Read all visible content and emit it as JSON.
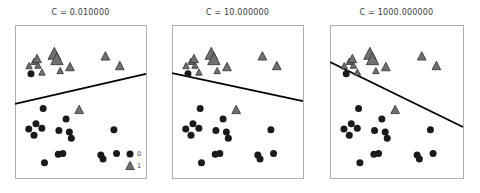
{
  "figure": {
    "background_color": "#ffffff",
    "frame_color": "#b0b0b0",
    "boundary_color": "#000000",
    "class0_color": "#1a1a1a",
    "class1_color": "#707070",
    "class1_edge_color": "#303030"
  },
  "panels": [
    {
      "id": "panel-1",
      "title": "C = 0.010000",
      "frame": {
        "x": 15,
        "y": 25,
        "width": 131,
        "height": 153
      },
      "has_legend": true,
      "legend": {
        "entries": [
          {
            "label": "0",
            "marker": "circle"
          },
          {
            "label": "1",
            "marker": "triangle"
          }
        ]
      },
      "boundary": {
        "x1": 15,
        "y1": 104,
        "x2": 146,
        "y2": 74
      }
    },
    {
      "id": "panel-2",
      "title": "C = 10.000000",
      "frame": {
        "x": 172,
        "y": 25,
        "width": 131,
        "height": 153
      },
      "has_legend": false,
      "boundary": {
        "x1": 172,
        "y1": 73,
        "x2": 303,
        "y2": 101
      }
    },
    {
      "id": "panel-3",
      "title": "C = 1000.000000",
      "frame": {
        "x": 330,
        "y": 25,
        "width": 133,
        "height": 153
      },
      "has_legend": false,
      "boundary": {
        "x1": 331,
        "y1": 62,
        "x2": 463,
        "y2": 127
      }
    }
  ],
  "chart_data": {
    "type": "scatter",
    "xlabel": "",
    "ylabel": "",
    "grid": false,
    "legend_position": "lower right (panel 1 only)",
    "class_labels": [
      "0",
      "1"
    ],
    "marker_map": {
      "0": "circle",
      "1": "triangle"
    },
    "panel_titles": [
      "C = 0.010000",
      "C = 10.000000",
      "C = 1000.000000"
    ],
    "panels": [
      {
        "title": "C = 0.010000",
        "boundary_line": {
          "x1": 0.0,
          "y1": 0.516,
          "x2": 1.0,
          "y2": 0.32
        },
        "points": [
          {
            "x": 0.107,
            "y": 0.268,
            "class": "1",
            "size": "small"
          },
          {
            "x": 0.145,
            "y": 0.24,
            "class": "1",
            "size": "small"
          },
          {
            "x": 0.168,
            "y": 0.222,
            "class": "1",
            "size": "medium"
          },
          {
            "x": 0.176,
            "y": 0.265,
            "class": "1",
            "size": "small"
          },
          {
            "x": 0.206,
            "y": 0.31,
            "class": "1",
            "size": "small"
          },
          {
            "x": 0.3,
            "y": 0.19,
            "class": "1",
            "size": "large"
          },
          {
            "x": 0.32,
            "y": 0.225,
            "class": "1",
            "size": "large"
          },
          {
            "x": 0.345,
            "y": 0.3,
            "class": "1",
            "size": "small"
          },
          {
            "x": 0.42,
            "y": 0.275,
            "class": "1",
            "size": "medium"
          },
          {
            "x": 0.69,
            "y": 0.205,
            "class": "1",
            "size": "medium"
          },
          {
            "x": 0.8,
            "y": 0.268,
            "class": "1",
            "size": "medium"
          },
          {
            "x": 0.122,
            "y": 0.318,
            "class": "0",
            "size": "medium"
          },
          {
            "x": 0.49,
            "y": 0.555,
            "class": "1",
            "size": "medium"
          },
          {
            "x": 0.215,
            "y": 0.545,
            "class": "0",
            "size": "medium"
          },
          {
            "x": 0.39,
            "y": 0.615,
            "class": "0",
            "size": "medium"
          },
          {
            "x": 0.16,
            "y": 0.645,
            "class": "0",
            "size": "medium"
          },
          {
            "x": 0.105,
            "y": 0.68,
            "class": "0",
            "size": "medium"
          },
          {
            "x": 0.205,
            "y": 0.675,
            "class": "0",
            "size": "medium"
          },
          {
            "x": 0.145,
            "y": 0.72,
            "class": "0",
            "size": "medium"
          },
          {
            "x": 0.335,
            "y": 0.69,
            "class": "0",
            "size": "medium"
          },
          {
            "x": 0.415,
            "y": 0.7,
            "class": "0",
            "size": "medium"
          },
          {
            "x": 0.43,
            "y": 0.74,
            "class": "0",
            "size": "medium"
          },
          {
            "x": 0.755,
            "y": 0.685,
            "class": "0",
            "size": "medium"
          },
          {
            "x": 0.33,
            "y": 0.845,
            "class": "0",
            "size": "medium"
          },
          {
            "x": 0.365,
            "y": 0.84,
            "class": "0",
            "size": "medium"
          },
          {
            "x": 0.225,
            "y": 0.9,
            "class": "0",
            "size": "medium"
          },
          {
            "x": 0.655,
            "y": 0.85,
            "class": "0",
            "size": "medium"
          },
          {
            "x": 0.672,
            "y": 0.875,
            "class": "0",
            "size": "medium"
          },
          {
            "x": 0.775,
            "y": 0.84,
            "class": "0",
            "size": "medium"
          }
        ]
      },
      {
        "title": "C = 10.000000",
        "boundary_line": {
          "x1": 0.0,
          "y1": 0.314,
          "x2": 1.0,
          "y2": 0.497
        },
        "points": [
          {
            "x": 0.107,
            "y": 0.268,
            "class": "1",
            "size": "small"
          },
          {
            "x": 0.145,
            "y": 0.24,
            "class": "1",
            "size": "small"
          },
          {
            "x": 0.168,
            "y": 0.222,
            "class": "1",
            "size": "medium"
          },
          {
            "x": 0.176,
            "y": 0.265,
            "class": "1",
            "size": "small"
          },
          {
            "x": 0.206,
            "y": 0.31,
            "class": "1",
            "size": "small"
          },
          {
            "x": 0.3,
            "y": 0.19,
            "class": "1",
            "size": "large"
          },
          {
            "x": 0.32,
            "y": 0.225,
            "class": "1",
            "size": "large"
          },
          {
            "x": 0.345,
            "y": 0.3,
            "class": "1",
            "size": "small"
          },
          {
            "x": 0.42,
            "y": 0.275,
            "class": "1",
            "size": "medium"
          },
          {
            "x": 0.69,
            "y": 0.205,
            "class": "1",
            "size": "medium"
          },
          {
            "x": 0.8,
            "y": 0.268,
            "class": "1",
            "size": "medium"
          },
          {
            "x": 0.122,
            "y": 0.318,
            "class": "0",
            "size": "medium"
          },
          {
            "x": 0.49,
            "y": 0.555,
            "class": "1",
            "size": "medium"
          },
          {
            "x": 0.215,
            "y": 0.545,
            "class": "0",
            "size": "medium"
          },
          {
            "x": 0.39,
            "y": 0.615,
            "class": "0",
            "size": "medium"
          },
          {
            "x": 0.16,
            "y": 0.645,
            "class": "0",
            "size": "medium"
          },
          {
            "x": 0.105,
            "y": 0.68,
            "class": "0",
            "size": "medium"
          },
          {
            "x": 0.205,
            "y": 0.675,
            "class": "0",
            "size": "medium"
          },
          {
            "x": 0.145,
            "y": 0.72,
            "class": "0",
            "size": "medium"
          },
          {
            "x": 0.335,
            "y": 0.69,
            "class": "0",
            "size": "medium"
          },
          {
            "x": 0.415,
            "y": 0.7,
            "class": "0",
            "size": "medium"
          },
          {
            "x": 0.43,
            "y": 0.74,
            "class": "0",
            "size": "medium"
          },
          {
            "x": 0.755,
            "y": 0.685,
            "class": "0",
            "size": "medium"
          },
          {
            "x": 0.33,
            "y": 0.845,
            "class": "0",
            "size": "medium"
          },
          {
            "x": 0.365,
            "y": 0.84,
            "class": "0",
            "size": "medium"
          },
          {
            "x": 0.225,
            "y": 0.9,
            "class": "0",
            "size": "medium"
          },
          {
            "x": 0.655,
            "y": 0.85,
            "class": "0",
            "size": "medium"
          },
          {
            "x": 0.672,
            "y": 0.875,
            "class": "0",
            "size": "medium"
          },
          {
            "x": 0.775,
            "y": 0.84,
            "class": "0",
            "size": "medium"
          }
        ]
      },
      {
        "title": "C = 1000.000000",
        "boundary_line": {
          "x1": 0.0,
          "y1": 0.242,
          "x2": 1.0,
          "y2": 0.667
        },
        "points": [
          {
            "x": 0.107,
            "y": 0.268,
            "class": "1",
            "size": "small"
          },
          {
            "x": 0.145,
            "y": 0.24,
            "class": "1",
            "size": "small"
          },
          {
            "x": 0.168,
            "y": 0.222,
            "class": "1",
            "size": "medium"
          },
          {
            "x": 0.176,
            "y": 0.265,
            "class": "1",
            "size": "small"
          },
          {
            "x": 0.206,
            "y": 0.31,
            "class": "1",
            "size": "small"
          },
          {
            "x": 0.3,
            "y": 0.19,
            "class": "1",
            "size": "large"
          },
          {
            "x": 0.32,
            "y": 0.225,
            "class": "1",
            "size": "large"
          },
          {
            "x": 0.345,
            "y": 0.3,
            "class": "1",
            "size": "small"
          },
          {
            "x": 0.42,
            "y": 0.275,
            "class": "1",
            "size": "medium"
          },
          {
            "x": 0.69,
            "y": 0.205,
            "class": "1",
            "size": "medium"
          },
          {
            "x": 0.8,
            "y": 0.268,
            "class": "1",
            "size": "medium"
          },
          {
            "x": 0.122,
            "y": 0.318,
            "class": "0",
            "size": "medium"
          },
          {
            "x": 0.49,
            "y": 0.555,
            "class": "1",
            "size": "medium"
          },
          {
            "x": 0.215,
            "y": 0.545,
            "class": "0",
            "size": "medium"
          },
          {
            "x": 0.39,
            "y": 0.615,
            "class": "0",
            "size": "medium"
          },
          {
            "x": 0.16,
            "y": 0.645,
            "class": "0",
            "size": "medium"
          },
          {
            "x": 0.105,
            "y": 0.68,
            "class": "0",
            "size": "medium"
          },
          {
            "x": 0.205,
            "y": 0.675,
            "class": "0",
            "size": "medium"
          },
          {
            "x": 0.145,
            "y": 0.72,
            "class": "0",
            "size": "medium"
          },
          {
            "x": 0.335,
            "y": 0.69,
            "class": "0",
            "size": "medium"
          },
          {
            "x": 0.415,
            "y": 0.7,
            "class": "0",
            "size": "medium"
          },
          {
            "x": 0.43,
            "y": 0.74,
            "class": "0",
            "size": "medium"
          },
          {
            "x": 0.755,
            "y": 0.685,
            "class": "0",
            "size": "medium"
          },
          {
            "x": 0.33,
            "y": 0.845,
            "class": "0",
            "size": "medium"
          },
          {
            "x": 0.365,
            "y": 0.84,
            "class": "0",
            "size": "medium"
          },
          {
            "x": 0.225,
            "y": 0.9,
            "class": "0",
            "size": "medium"
          },
          {
            "x": 0.655,
            "y": 0.85,
            "class": "0",
            "size": "medium"
          },
          {
            "x": 0.672,
            "y": 0.875,
            "class": "0",
            "size": "medium"
          },
          {
            "x": 0.775,
            "y": 0.84,
            "class": "0",
            "size": "medium"
          }
        ]
      }
    ]
  }
}
